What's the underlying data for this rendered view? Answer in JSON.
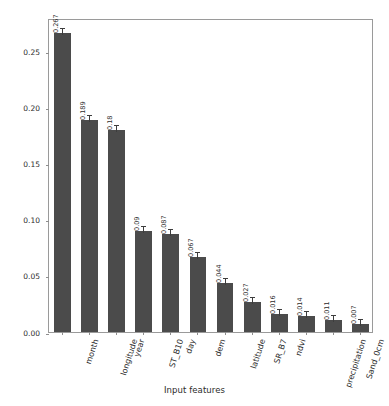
{
  "chart_data": {
    "type": "bar",
    "title": "",
    "xlabel": "Input features",
    "ylabel": "Feature scores (0-1)",
    "ylim": [
      0,
      0.28
    ],
    "grid": false,
    "legend": false,
    "bar_color": "#4b4b4b",
    "ytick_labels": [
      "0.00",
      "0.05",
      "0.10",
      "0.15",
      "0.20",
      "0.25"
    ],
    "ytick_values": [
      0.0,
      0.05,
      0.1,
      0.15,
      0.2,
      0.25
    ],
    "categories": [
      "month",
      "longitude",
      "year",
      "ST_B10",
      "day",
      "dem",
      "latitude",
      "SR_B7",
      "ndvi",
      "precipitation",
      "Sand_0cm",
      "Clay_0cm"
    ],
    "values": [
      0.267,
      0.189,
      0.18,
      0.09,
      0.087,
      0.067,
      0.044,
      0.027,
      0.016,
      0.014,
      0.011,
      0.007
    ],
    "value_labels": [
      "0.267",
      "0.189",
      "0.18",
      "0.09",
      "0.087",
      "0.067",
      "0.044",
      "0.027",
      "0.016",
      "0.014",
      "0.011",
      "0.007"
    ]
  }
}
